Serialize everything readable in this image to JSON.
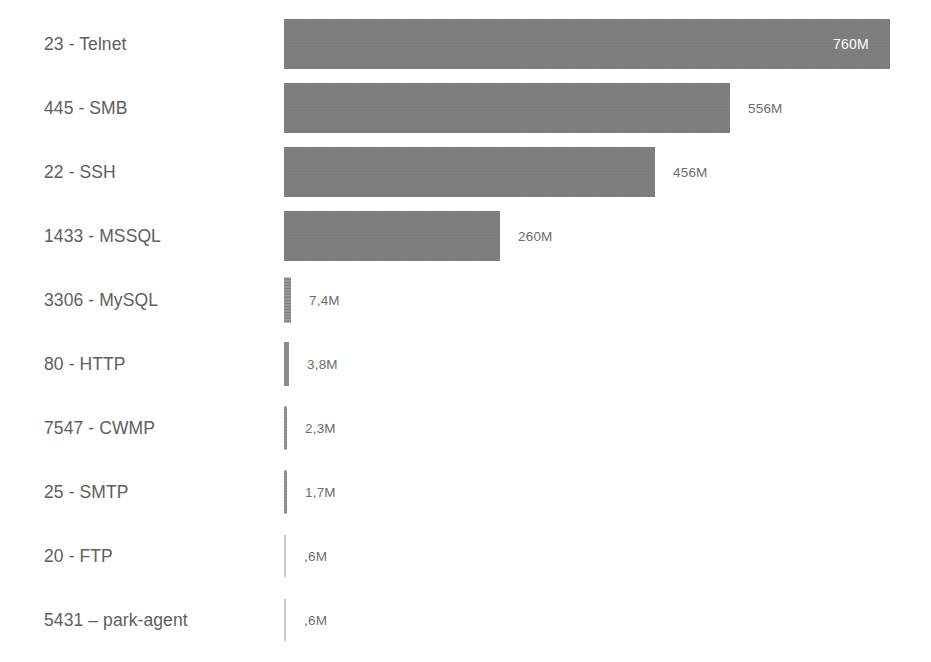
{
  "chart_data": {
    "type": "bar",
    "orientation": "horizontal",
    "title": "",
    "subtitle": "",
    "xlabel": "",
    "ylabel": "",
    "grid": false,
    "legend": null,
    "axis_visible": false,
    "value_unit": "M",
    "decimal_separator": ",",
    "xlim": [
      0,
      760
    ],
    "categories": [
      "23 - Telnet",
      "445 - SMB",
      "22 - SSH",
      "1433 - MSSQL",
      "3306 - MySQL",
      "80 - HTTP",
      "7547 - CWMP",
      "25 - SMTP",
      "20 - FTP",
      "5431 – park-agent"
    ],
    "values": [
      760,
      556,
      456,
      260,
      7.4,
      3.8,
      2.3,
      1.7,
      0.6,
      0.6
    ],
    "value_labels": [
      "760M",
      "556M",
      "456M",
      "260M",
      "7,4M",
      "3,8M",
      "2,3M",
      "1,7M",
      ",6M",
      ",6M"
    ],
    "colors": {
      "bar": "#7d7d7d",
      "bar_small": "#8e8e8e",
      "bar_faint": "#c9c9c9",
      "label_text": "#5e5e5e",
      "value_text": "#6d6d6d",
      "value_text_inside": "#ffffff",
      "background": "#ffffff"
    },
    "bars": [
      {
        "category": "23 - Telnet",
        "value": 760,
        "label": "760M",
        "bar_px": 606,
        "height_px": 50,
        "label_inside": true,
        "style": "solid"
      },
      {
        "category": "445 - SMB",
        "value": 556,
        "label": "556M",
        "bar_px": 446,
        "height_px": 50,
        "label_inside": false,
        "style": "solid"
      },
      {
        "category": "22 - SSH",
        "value": 456,
        "label": "456M",
        "bar_px": 371,
        "height_px": 50,
        "label_inside": false,
        "style": "solid"
      },
      {
        "category": "1433 - MSSQL",
        "value": 260,
        "label": "260M",
        "bar_px": 216,
        "height_px": 50,
        "label_inside": false,
        "style": "solid"
      },
      {
        "category": "3306 - MySQL",
        "value": 7.4,
        "label": "7,4M",
        "bar_px": 7,
        "height_px": 45,
        "label_inside": false,
        "style": "thin"
      },
      {
        "category": "80 - HTTP",
        "value": 3.8,
        "label": "3,8M",
        "bar_px": 5,
        "height_px": 44,
        "label_inside": false,
        "style": "thin"
      },
      {
        "category": "7547 - CWMP",
        "value": 2.3,
        "label": "2,3M",
        "bar_px": 3,
        "height_px": 43,
        "label_inside": false,
        "style": "thin"
      },
      {
        "category": "25 - SMTP",
        "value": 1.7,
        "label": "1,7M",
        "bar_px": 3,
        "height_px": 43,
        "label_inside": false,
        "style": "thin"
      },
      {
        "category": "20 - FTP",
        "value": 0.6,
        "label": ",6M",
        "bar_px": 2,
        "height_px": 42,
        "label_inside": false,
        "style": "faint"
      },
      {
        "category": "5431 – park-agent",
        "value": 0.6,
        "label": ",6M",
        "bar_px": 2,
        "height_px": 42,
        "label_inside": false,
        "style": "faint"
      }
    ]
  }
}
